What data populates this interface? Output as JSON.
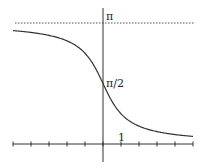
{
  "chart_data": {
    "type": "line",
    "title": "",
    "function": "arccot(x)",
    "xlabel": "",
    "ylabel": "",
    "xlim": [
      -5,
      5
    ],
    "ylim": [
      -0.8,
      3.4
    ],
    "grid": false,
    "legend": null,
    "x_ticks": [
      -5,
      -4,
      -3,
      -2,
      -1,
      0,
      1,
      2,
      3,
      4,
      5
    ],
    "tick_labels": {
      "x": [
        "1"
      ],
      "y": [
        "π/2",
        "π"
      ]
    },
    "asymptote": {
      "y": 3.14159,
      "label": "π",
      "style": "dotted"
    },
    "marked_point": {
      "x": 0,
      "y": 1.5708,
      "label": "π/2"
    },
    "series": [
      {
        "name": "arccot(x)",
        "x": [
          -5,
          -4,
          -3,
          -2,
          -1,
          -0.5,
          0,
          0.5,
          1,
          2,
          3,
          4,
          5
        ],
        "values": [
          2.944,
          2.897,
          2.82,
          2.678,
          2.356,
          2.034,
          1.571,
          1.107,
          0.785,
          0.464,
          0.322,
          0.245,
          0.197
        ]
      }
    ]
  },
  "labels": {
    "pi": "π",
    "half_pi": "π/2",
    "one": "1"
  }
}
